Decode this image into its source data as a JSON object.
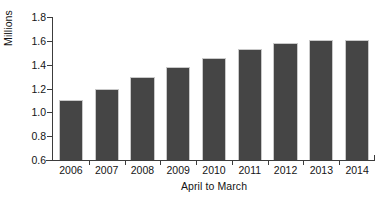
{
  "chart_data": {
    "type": "bar",
    "title": "",
    "subtitle": "",
    "xlabel": "April to March",
    "ylabel": "Millions",
    "categories": [
      "2006",
      "2007",
      "2008",
      "2009",
      "2010",
      "2011",
      "2012",
      "2013",
      "2014"
    ],
    "values": [
      1.1,
      1.2,
      1.3,
      1.38,
      1.46,
      1.53,
      1.58,
      1.61,
      1.61
    ],
    "series": [
      {
        "name": "Millions",
        "values": [
          1.1,
          1.2,
          1.3,
          1.38,
          1.46,
          1.53,
          1.58,
          1.61,
          1.61
        ]
      }
    ],
    "ylim": [
      0.6,
      1.8
    ],
    "ytick_step": 0.2,
    "ytick_labels": [
      "1.8",
      "1.6",
      "1.4",
      "1.2",
      "1.0",
      "0.8",
      "0.6"
    ],
    "ytick_values": [
      1.8,
      1.6,
      1.4,
      1.2,
      1.0,
      0.8,
      0.6
    ],
    "grid": false,
    "legend": null,
    "legend_position": "none",
    "annotations": [],
    "bar_color": "#454545",
    "bar_edge_color": "#c9c9c9",
    "axis_color": "#3c3c3c",
    "background_color": "#ffffff",
    "text_color": "#141414"
  }
}
